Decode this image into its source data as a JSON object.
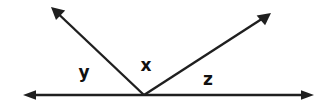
{
  "figure": {
    "kind": "geometry-angle-diagram",
    "width": 331,
    "height": 108,
    "background_color": "#ffffff",
    "stroke_color": "#1f1f1f",
    "label_color": "#111111",
    "stroke_width": 2.4
  },
  "vertex": {
    "name": "common-vertex",
    "x": 144,
    "y": 95
  },
  "rays": [
    {
      "id": "baseline-left",
      "description": "horizontal ray pointing left from vertex",
      "from_x": 144,
      "from_y": 95,
      "to_x": 23,
      "to_y": 95,
      "arrowhead": true
    },
    {
      "id": "baseline-right",
      "description": "horizontal ray pointing right from vertex",
      "from_x": 144,
      "from_y": 95,
      "to_x": 314,
      "to_y": 95,
      "arrowhead": true
    },
    {
      "id": "ray-upper-left",
      "description": "ray rising to the upper left from vertex",
      "from_x": 144,
      "from_y": 95,
      "to_x": 51,
      "to_y": 7,
      "arrowhead": true
    },
    {
      "id": "ray-upper-right",
      "description": "ray rising to the upper right from vertex",
      "from_x": 144,
      "from_y": 95,
      "to_x": 271,
      "to_y": 13,
      "arrowhead": true
    }
  ],
  "labels": [
    {
      "id": "angle-y",
      "text": "y",
      "x": 84,
      "y": 73,
      "description": "angle between left baseline ray and upper-left ray"
    },
    {
      "id": "angle-x",
      "text": "x",
      "x": 146,
      "y": 66,
      "description": "angle between upper-left ray and upper-right ray"
    },
    {
      "id": "angle-z",
      "text": "z",
      "x": 208,
      "y": 80,
      "description": "angle between upper-right ray and right baseline ray"
    }
  ]
}
